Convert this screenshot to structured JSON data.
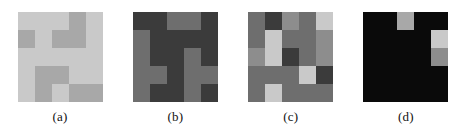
{
  "figure": {
    "type": "grayscale-grid-panels",
    "panel_count": 4,
    "grid_rows": 5,
    "grid_cols": 5,
    "background": "#ffffff"
  },
  "chart_data": {
    "type": "heatmap",
    "title": "",
    "xlabel": "",
    "ylabel": "",
    "grid": false,
    "legend": "none",
    "colormap": "grayscale",
    "panels": [
      {
        "label": "(a)",
        "rows": 5,
        "cols": 5,
        "palette": [
          "#c9c9c9",
          "#a8a8a8",
          "#9a9a9a"
        ],
        "values": [
          [
            "#c9c9c9",
            "#c9c9c9",
            "#c9c9c9",
            "#a8a8a8",
            "#c9c9c9"
          ],
          [
            "#a8a8a8",
            "#c9c9c9",
            "#a8a8a8",
            "#a8a8a8",
            "#c9c9c9"
          ],
          [
            "#c9c9c9",
            "#c9c9c9",
            "#c9c9c9",
            "#c9c9c9",
            "#c9c9c9"
          ],
          [
            "#c9c9c9",
            "#a8a8a8",
            "#a8a8a8",
            "#c9c9c9",
            "#c9c9c9"
          ],
          [
            "#c9c9c9",
            "#a8a8a8",
            "#c9c9c9",
            "#a8a8a8",
            "#a8a8a8"
          ]
        ]
      },
      {
        "label": "(b)",
        "rows": 5,
        "cols": 5,
        "palette": [
          "#6e6e6e",
          "#3b3b3b"
        ],
        "values": [
          [
            "#3b3b3b",
            "#3b3b3b",
            "#6e6e6e",
            "#6e6e6e",
            "#3b3b3b"
          ],
          [
            "#6e6e6e",
            "#3b3b3b",
            "#3b3b3b",
            "#3b3b3b",
            "#3b3b3b"
          ],
          [
            "#6e6e6e",
            "#3b3b3b",
            "#3b3b3b",
            "#6e6e6e",
            "#3b3b3b"
          ],
          [
            "#6e6e6e",
            "#6e6e6e",
            "#3b3b3b",
            "#6e6e6e",
            "#6e6e6e"
          ],
          [
            "#6e6e6e",
            "#3b3b3b",
            "#3b3b3b",
            "#6e6e6e",
            "#3b3b3b"
          ]
        ]
      },
      {
        "label": "(c)",
        "rows": 5,
        "cols": 5,
        "palette": [
          "#c9c9c9",
          "#8d8d8d",
          "#6e6e6e",
          "#3b3b3b"
        ],
        "values": [
          [
            "#6e6e6e",
            "#3b3b3b",
            "#8d8d8d",
            "#6e6e6e",
            "#c9c9c9"
          ],
          [
            "#6e6e6e",
            "#c9c9c9",
            "#6e6e6e",
            "#6e6e6e",
            "#8d8d8d"
          ],
          [
            "#8d8d8d",
            "#c9c9c9",
            "#3b3b3b",
            "#6e6e6e",
            "#8d8d8d"
          ],
          [
            "#6e6e6e",
            "#6e6e6e",
            "#6e6e6e",
            "#c9c9c9",
            "#3b3b3b"
          ],
          [
            "#6e6e6e",
            "#c9c9c9",
            "#6e6e6e",
            "#6e6e6e",
            "#6e6e6e"
          ]
        ]
      },
      {
        "label": "(d)",
        "rows": 5,
        "cols": 5,
        "palette": [
          "#0a0a0a",
          "#a8a8a8",
          "#c9c9c9",
          "#8d8d8d"
        ],
        "values": [
          [
            "#0a0a0a",
            "#0a0a0a",
            "#a8a8a8",
            "#0a0a0a",
            "#0a0a0a"
          ],
          [
            "#0a0a0a",
            "#0a0a0a",
            "#0a0a0a",
            "#0a0a0a",
            "#c9c9c9"
          ],
          [
            "#0a0a0a",
            "#0a0a0a",
            "#0a0a0a",
            "#0a0a0a",
            "#8d8d8d"
          ],
          [
            "#0a0a0a",
            "#0a0a0a",
            "#0a0a0a",
            "#0a0a0a",
            "#0a0a0a"
          ],
          [
            "#0a0a0a",
            "#0a0a0a",
            "#0a0a0a",
            "#0a0a0a",
            "#0a0a0a"
          ]
        ]
      }
    ]
  }
}
